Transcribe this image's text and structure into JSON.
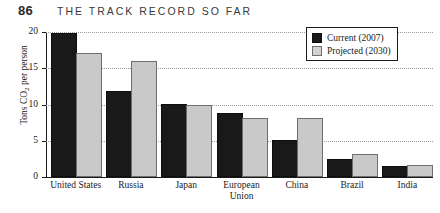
{
  "running_head": {
    "page_number": "86",
    "title": "THE TRACK RECORD SO FAR"
  },
  "chart_data": {
    "type": "bar",
    "title": "",
    "xlabel": "",
    "ylabel": "Tons CO2 per person",
    "ylim": [
      0,
      20
    ],
    "yticks": [
      "0",
      "5",
      "10",
      "15",
      "20"
    ],
    "grid": true,
    "legend_position": "top-right",
    "categories": [
      "United States",
      "Russia",
      "Japan",
      "European Union",
      "China",
      "Brazil",
      "India"
    ],
    "category_lines": [
      [
        "United States"
      ],
      [
        "Russia"
      ],
      [
        "Japan"
      ],
      [
        "European",
        "Union"
      ],
      [
        "China"
      ],
      [
        "Brazil"
      ],
      [
        "India"
      ]
    ],
    "series": [
      {
        "name": "Current (2007)",
        "color": "#191919",
        "values": [
          19.6,
          11.6,
          9.8,
          8.6,
          4.8,
          2.2,
          1.3
        ]
      },
      {
        "name": "Projected (2030)",
        "color": "#c9c9c9",
        "values": [
          16.8,
          15.7,
          9.7,
          7.9,
          7.9,
          2.9,
          1.4
        ]
      }
    ]
  },
  "legend": {
    "items": [
      {
        "label": "Current (2007)"
      },
      {
        "label": "Projected (2030)"
      }
    ]
  }
}
